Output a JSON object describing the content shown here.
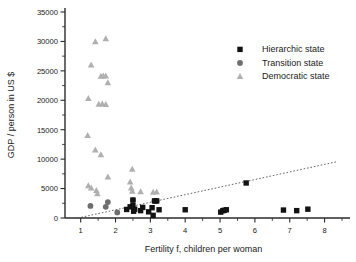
{
  "chart_data": {
    "type": "scatter",
    "title": "",
    "xlabel": "Fertility f, children per woman",
    "ylabel": "GDP / person in US $",
    "xlim": [
      0.55,
      8.5
    ],
    "ylim": [
      0,
      35000
    ],
    "xticks": [
      1,
      2,
      3,
      4,
      5,
      6,
      7,
      8
    ],
    "xticklabels": [
      "1",
      "2",
      "3",
      "4",
      "5",
      "6",
      "7",
      "8"
    ],
    "xtick_minor_step": 0.5,
    "yticks": [
      0,
      5000,
      10000,
      15000,
      20000,
      25000,
      30000,
      35000
    ],
    "yticklabels": [
      "0",
      "5000",
      "10000",
      "15000",
      "20000",
      "25000",
      "30000",
      "35000"
    ],
    "ytick_minor_step": 2500,
    "grid": false,
    "legend_position": "upper right",
    "series": [
      {
        "name": "Hierarchic state",
        "marker": "square",
        "color": "#121212",
        "points": [
          [
            2.32,
            1450
          ],
          [
            2.42,
            1900
          ],
          [
            2.5,
            3050
          ],
          [
            2.5,
            2100
          ],
          [
            2.52,
            1150
          ],
          [
            2.55,
            1500
          ],
          [
            2.72,
            1250
          ],
          [
            2.78,
            1800
          ],
          [
            2.95,
            1050
          ],
          [
            3.05,
            1750
          ],
          [
            3.08,
            450
          ],
          [
            3.12,
            2900
          ],
          [
            3.18,
            2900
          ],
          [
            3.25,
            1400
          ],
          [
            4.0,
            1400
          ],
          [
            5.02,
            1000
          ],
          [
            5.08,
            1250
          ],
          [
            5.12,
            1300
          ],
          [
            5.18,
            1400
          ],
          [
            5.75,
            5950
          ],
          [
            6.82,
            1350
          ],
          [
            7.2,
            1250
          ],
          [
            7.52,
            1500
          ]
        ]
      },
      {
        "name": "Transition state",
        "marker": "circle",
        "color": "#6e6e6e",
        "points": [
          [
            1.28,
            2050
          ],
          [
            1.72,
            1900
          ],
          [
            1.78,
            2700
          ],
          [
            2.05,
            950
          ],
          [
            2.5,
            3050
          ],
          [
            3.12,
            2900
          ],
          [
            3.18,
            2900
          ]
        ]
      },
      {
        "name": "Democratic state",
        "marker": "triangle",
        "color": "#b0b0b0",
        "points": [
          [
            1.42,
            30000
          ],
          [
            1.72,
            30500
          ],
          [
            1.3,
            26050
          ],
          [
            1.58,
            24100
          ],
          [
            1.65,
            24150
          ],
          [
            1.72,
            24150
          ],
          [
            1.78,
            23000
          ],
          [
            1.22,
            20350
          ],
          [
            1.52,
            19350
          ],
          [
            1.62,
            19400
          ],
          [
            1.72,
            19300
          ],
          [
            1.2,
            14050
          ],
          [
            1.42,
            11600
          ],
          [
            1.58,
            10800
          ],
          [
            1.78,
            7000
          ],
          [
            2.48,
            8300
          ],
          [
            1.22,
            5500
          ],
          [
            1.3,
            5150
          ],
          [
            1.45,
            4700
          ],
          [
            1.48,
            4150
          ],
          [
            2.42,
            6150
          ],
          [
            2.45,
            5150
          ],
          [
            2.48,
            4600
          ],
          [
            2.72,
            4500
          ],
          [
            3.08,
            4400
          ],
          [
            3.18,
            4450
          ]
        ]
      }
    ],
    "trendline": {
      "label": "",
      "style": "dotted",
      "color": "#555555",
      "start": [
        0.92,
        0
      ],
      "end": [
        8.38,
        9600
      ]
    }
  },
  "legend": {
    "entries": [
      {
        "label": "Hierarchic state",
        "marker": "square",
        "color": "#121212"
      },
      {
        "label": "Transition state",
        "marker": "circle",
        "color": "#6e6e6e"
      },
      {
        "label": "Democratic state",
        "marker": "triangle",
        "color": "#b0b0b0"
      }
    ]
  }
}
